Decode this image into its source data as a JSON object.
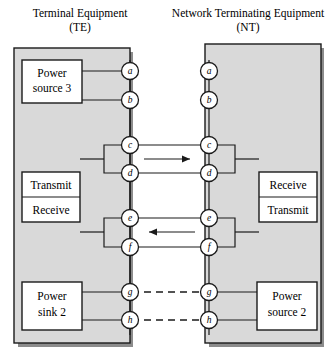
{
  "figure": {
    "type": "interface-wiring-diagram",
    "background_color": "#ffffff",
    "panel_color": "#d9d9d9",
    "line_color": "#1a1a1a"
  },
  "titles": {
    "left": {
      "line1": "Terminal Equipment",
      "line2": "(TE)"
    },
    "right": {
      "line1": "Network Terminating Equipment",
      "line2": "(NT)"
    }
  },
  "boxes": {
    "te_power_source": {
      "line1": "Power",
      "line2": "source 3"
    },
    "te_transmit": "Transmit",
    "te_receive": "Receive",
    "te_power_sink": {
      "line1": "Power",
      "line2": "sink 2"
    },
    "nt_receive": "Receive",
    "nt_transmit": "Transmit",
    "nt_power_source": {
      "line1": "Power",
      "line2": "source 2"
    }
  },
  "contacts": {
    "te": [
      {
        "label": "a",
        "y": 71
      },
      {
        "label": "b",
        "y": 100
      },
      {
        "label": "c",
        "y": 145
      },
      {
        "label": "d",
        "y": 173
      },
      {
        "label": "e",
        "y": 218
      },
      {
        "label": "f",
        "y": 247
      },
      {
        "label": "g",
        "y": 292
      },
      {
        "label": "h",
        "y": 320
      }
    ],
    "nt": [
      {
        "label": "a",
        "y": 71
      },
      {
        "label": "b",
        "y": 100
      },
      {
        "label": "c",
        "y": 145
      },
      {
        "label": "d",
        "y": 173
      },
      {
        "label": "e",
        "y": 218
      },
      {
        "label": "f",
        "y": 247
      },
      {
        "label": "g",
        "y": 292
      },
      {
        "label": "h",
        "y": 320
      }
    ]
  },
  "links": [
    {
      "name": "c-d-pair",
      "direction": "right",
      "style": "solid",
      "from": "c",
      "to": "d"
    },
    {
      "name": "e-f-pair",
      "direction": "left",
      "style": "solid",
      "from": "e",
      "to": "f"
    },
    {
      "name": "g-pair",
      "direction": "none",
      "style": "dashed",
      "from": "g",
      "to": "g"
    },
    {
      "name": "h-pair",
      "direction": "none",
      "style": "dashed",
      "from": "h",
      "to": "h"
    }
  ]
}
